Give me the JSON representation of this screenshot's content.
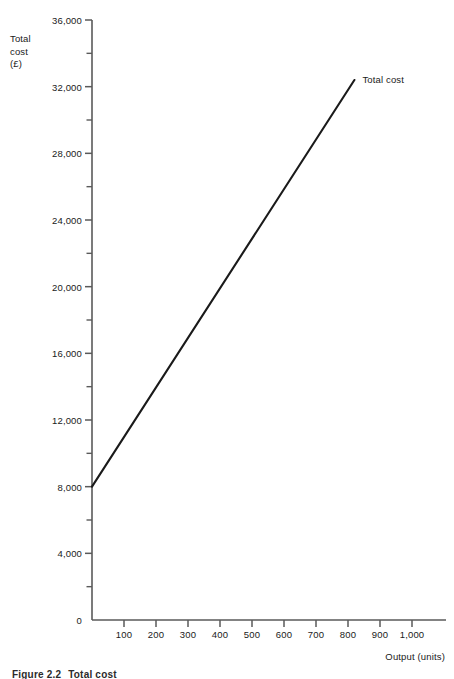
{
  "chart_data": {
    "type": "line",
    "title": "",
    "xlabel": "Output (units)",
    "ylabel": "Total cost (£)",
    "xlim": [
      0,
      1000
    ],
    "ylim": [
      0,
      36000
    ],
    "grid": false,
    "legend_position": "inline-right",
    "x_ticks": [
      0,
      100,
      200,
      300,
      400,
      500,
      600,
      700,
      800,
      900,
      1000
    ],
    "x_tick_labels": [
      "0",
      "100",
      "200",
      "300",
      "400",
      "500",
      "600",
      "700",
      "800",
      "900",
      "1,000"
    ],
    "y_ticks": [
      0,
      4000,
      8000,
      12000,
      16000,
      20000,
      24000,
      28000,
      32000,
      36000
    ],
    "y_tick_labels": [
      "0",
      "4,000",
      "8,000",
      "12,000",
      "16,000",
      "20,000",
      "24,000",
      "28,000",
      "32,000",
      "36,000"
    ],
    "y_minor_ticks": [
      2000,
      6000,
      10000,
      14000,
      18000,
      22000,
      26000,
      30000,
      34000
    ],
    "series": [
      {
        "name": "Total cost",
        "annotation": "Total cost",
        "color": "#1a1a1a",
        "x": [
          0,
          820
        ],
        "values": [
          8000,
          32400
        ],
        "intercept": 8000,
        "slope_per_unit": 29.76
      }
    ]
  },
  "y_axis": {
    "title": "Total\ncost\n(£)",
    "labels": [
      "36,000",
      "32,000",
      "28,000",
      "24,000",
      "20,000",
      "16,000",
      "12,000",
      "8,000",
      "4,000",
      "0"
    ],
    "values": [
      36000,
      32000,
      28000,
      24000,
      20000,
      16000,
      12000,
      8000,
      4000,
      0
    ]
  },
  "x_axis": {
    "title": "Output (units)",
    "labels": [
      "100",
      "200",
      "300",
      "400",
      "500",
      "600",
      "700",
      "800",
      "900",
      "1,000"
    ],
    "values": [
      100,
      200,
      300,
      400,
      500,
      600,
      700,
      800,
      900,
      1000
    ]
  },
  "annotations": {
    "total_cost_label": "Total cost"
  },
  "caption": {
    "number": "Figure 2.2",
    "text": "Total cost"
  },
  "colors": {
    "line": "#1a1a1a",
    "axis": "#5a5a5a",
    "text": "#1a1a1a",
    "background": "#ffffff"
  }
}
